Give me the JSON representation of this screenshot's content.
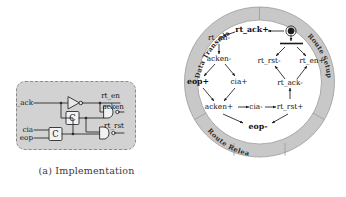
{
  "figure": {
    "panels": [
      {
        "id": "a",
        "caption": "(a) Implementation"
      },
      {
        "id": "b",
        "caption": "(b) Signal Transition Graph"
      }
    ]
  },
  "implementation": {
    "inputs": [
      {
        "name": "rt_ack",
        "label": "rt_ack"
      },
      {
        "name": "cia",
        "label": "cia"
      },
      {
        "name": "eop",
        "label": "eop"
      }
    ],
    "outputs": [
      {
        "name": "rt_en",
        "label": "rt_en"
      },
      {
        "name": "acken",
        "label": "acken"
      },
      {
        "name": "rt_rst",
        "label": "rt_rst"
      }
    ],
    "gates": [
      {
        "name": "inverter",
        "label": ""
      },
      {
        "name": "nand-acken",
        "label": ""
      },
      {
        "name": "c-element-upper",
        "label": "C"
      },
      {
        "name": "c-element-lower",
        "label": "C"
      },
      {
        "name": "nand-rt-rst",
        "label": ""
      }
    ]
  },
  "stg": {
    "sectors": [
      {
        "name": "data-transmission",
        "label": "Data Transmission"
      },
      {
        "name": "route-setup",
        "label": "Route Setup"
      },
      {
        "name": "route-release",
        "label": "Route Release"
      }
    ],
    "transitions": [
      {
        "id": "rt_ack_plus",
        "label": "rt_ack+",
        "bold": true
      },
      {
        "id": "rt_en_minus",
        "label": "rt_en-",
        "bold": false
      },
      {
        "id": "acken_minus",
        "label": "acken-",
        "bold": false
      },
      {
        "id": "eop_plus",
        "label": "eop+",
        "bold": true
      },
      {
        "id": "cia_plus",
        "label": "cia+",
        "bold": false
      },
      {
        "id": "acken_plus",
        "label": "acken+",
        "bold": false
      },
      {
        "id": "cia_minus",
        "label": "cia-",
        "bold": false
      },
      {
        "id": "rt_rst_plus",
        "label": "rt_rst+",
        "bold": false
      },
      {
        "id": "eop_minus",
        "label": "eop-",
        "bold": true
      },
      {
        "id": "rt_ack_minus",
        "label": "rt_ack-",
        "bold": false
      },
      {
        "id": "rt_rst_minus",
        "label": "rt_rst-",
        "bold": false
      },
      {
        "id": "rt_en_plus",
        "label": "rt_en+",
        "bold": false
      }
    ],
    "marking": {
      "name": "initial-token",
      "label": ""
    }
  },
  "colors": {
    "ring_fill": "#c8c8c8",
    "ring_stroke": "#9a9a9a",
    "box_fill": "#d2d2d2",
    "box_stroke": "#8a8a8a",
    "ink": "#111111",
    "caption": "#3a3a3a"
  }
}
